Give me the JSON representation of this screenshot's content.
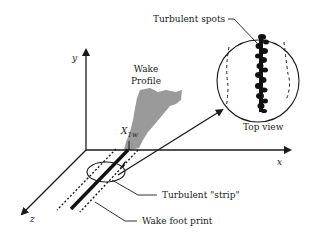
{
  "diagram": {
    "axes": {
      "x_label": "x",
      "y_label": "y",
      "z_label": "z"
    },
    "labels": {
      "wake_profile_line1": "Wake",
      "wake_profile_line2": "Profile",
      "x1w_main": "X",
      "x1w_sub": "1w",
      "turbulent_spots": "Turbulent spots",
      "top_view": "Top view",
      "turbulent_strip": "Turbulent \"strip\"",
      "wake_foot_print": "Wake foot print"
    },
    "colors": {
      "line": "#1a1a1a",
      "wake_fill": "#9a9a9a",
      "background": "#ffffff"
    }
  }
}
